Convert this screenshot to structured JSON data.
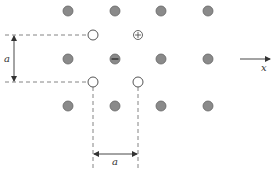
{
  "diagram": {
    "title": "",
    "lattice": {
      "rows": [
        [
          "atom",
          "atom",
          "atom",
          "atom"
        ],
        [
          "empty",
          "vacancy",
          "positive-ion",
          "empty"
        ],
        [
          "atom",
          "negative-ion",
          "atom",
          "atom"
        ],
        [
          "empty",
          "vacancy",
          "vacancy",
          "empty"
        ],
        [
          "atom",
          "atom",
          "atom",
          "atom"
        ]
      ],
      "note": "Square lattice with spacing a; rows 1,3,5 have filled atoms at columns 1-4; rows 2 and 4 have sites at the half-offset positions"
    },
    "symbols": {
      "positive": "+",
      "negative": "−"
    },
    "labels": {
      "vertical_spacing": "a",
      "horizontal_spacing": "a",
      "axis": "x"
    },
    "colors": {
      "atom_fill": "#8a8a8a",
      "atom_stroke": "#666666",
      "open_fill": "#ffffff",
      "open_stroke": "#555555"
    }
  }
}
